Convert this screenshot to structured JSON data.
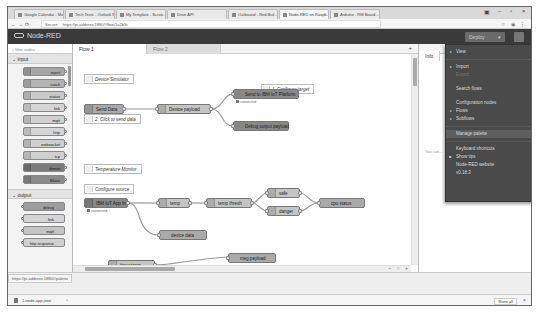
{
  "browser": {
    "tabs": [
      {
        "label": "Google Calendar - Mon..."
      },
      {
        "label": "Tech Tests - Outlook N..."
      },
      {
        "label": "My Template - Scratc..."
      },
      {
        "label": "Drive API"
      },
      {
        "label": "Outbound - Red Buil..."
      },
      {
        "label": "Node-RED on Raspb..."
      },
      {
        "label": "Arduino - RM Board..."
      }
    ],
    "url_prefix": "Secure",
    "url": "https://pi-address:1880/#flow/1a2b3c",
    "nav_icons": [
      "back-icon",
      "forward-icon",
      "reload-icon"
    ],
    "window_controls": [
      "–",
      "▫",
      "×"
    ]
  },
  "header": {
    "app_title": "Node-RED",
    "deploy_label": "Deploy",
    "deploy_caret": "▾",
    "menu_icon": "hamburger-icon"
  },
  "palette": {
    "filter_placeholder": "filter nodes",
    "categories": [
      {
        "label": "input",
        "nodes": [
          {
            "label": "inject",
            "color": "#a6a6a6"
          },
          {
            "label": "catch",
            "color": "#b3b3b3"
          },
          {
            "label": "status",
            "color": "#c9c9c9"
          },
          {
            "label": "link",
            "color": "#d5d5d5"
          },
          {
            "label": "mqtt",
            "color": "#d0d0d0"
          },
          {
            "label": "http",
            "color": "#d5d5d5"
          },
          {
            "label": "websocket",
            "color": "#cfcfcf"
          },
          {
            "label": "tcp",
            "color": "#cfcfcf"
          },
          {
            "label": "ibmiot",
            "color": "#7a7a7a"
          },
          {
            "label": "Bluez",
            "color": "#8a8a8a"
          }
        ]
      },
      {
        "label": "output",
        "nodes": [
          {
            "label": "debug",
            "color": "#9e9e9e"
          },
          {
            "label": "link",
            "color": "#d5d5d5"
          },
          {
            "label": "mqtt",
            "color": "#c4c4c4"
          },
          {
            "label": "http response",
            "color": "#d0d0d0"
          }
        ]
      }
    ]
  },
  "workspace": {
    "tabs": [
      {
        "label": "Flow 1",
        "active": true
      },
      {
        "label": "Flow 2",
        "active": false
      }
    ],
    "add_tab_label": "+",
    "comments": [
      {
        "label": "Device Simulator"
      },
      {
        "label": "1. Configure target"
      },
      {
        "label": "2. Click to send data"
      },
      {
        "label": "Temperature Monitor"
      },
      {
        "label": "Configure source"
      }
    ],
    "nodes": [
      {
        "label": "Send Data"
      },
      {
        "label": "Device payload"
      },
      {
        "label": "Send to IBM IoT Platform"
      },
      {
        "label": "Debug output payload"
      },
      {
        "label": "IBM IoT App In"
      },
      {
        "label": "temp"
      },
      {
        "label": "temp thresh"
      },
      {
        "label": "safe"
      },
      {
        "label": "danger"
      },
      {
        "label": "cpu status"
      },
      {
        "label": "device data"
      },
      {
        "label": "timestamp"
      },
      {
        "label": "msg.payload"
      }
    ],
    "statuses": [
      {
        "label": "connected"
      },
      {
        "label": "connected"
      }
    ],
    "footer_controls": "– ○ +"
  },
  "sidebar": {
    "tab_label": "Info",
    "body_text": "You can..."
  },
  "menu": {
    "items": [
      {
        "label": "View",
        "type": "sub"
      },
      {
        "type": "sep"
      },
      {
        "label": "Import",
        "type": "sub"
      },
      {
        "label": "Export",
        "type": "disabled"
      },
      {
        "type": "gap"
      },
      {
        "label": "Search flows",
        "type": "plain"
      },
      {
        "type": "gap"
      },
      {
        "label": "Configuration nodes",
        "type": "plain"
      },
      {
        "label": "Flows",
        "type": "sub"
      },
      {
        "label": "Subflows",
        "type": "sub"
      },
      {
        "type": "sep"
      },
      {
        "label": "Manage palette",
        "type": "hl"
      },
      {
        "type": "sep"
      },
      {
        "label": "Keyboard shortcuts",
        "type": "plain"
      },
      {
        "label": "Show tips",
        "type": "check"
      },
      {
        "label": "Node-RED website",
        "type": "plain"
      },
      {
        "label": "v0.18.3",
        "type": "plain"
      }
    ]
  },
  "statusbar": {
    "hover_url": "https://pi-address:1880/#palette"
  },
  "downloads": {
    "item_label": "1-node-app.json",
    "caret": "^",
    "show_all_label": "Show all",
    "close": "×"
  }
}
